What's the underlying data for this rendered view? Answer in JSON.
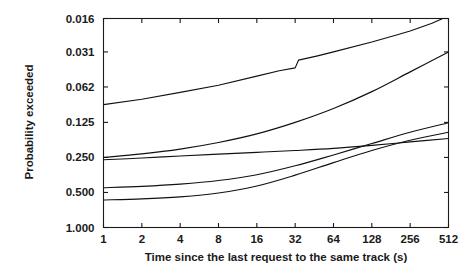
{
  "chart_data": {
    "type": "line",
    "title": "",
    "xlabel": "Time since the last request to the same track (s)",
    "ylabel": "Probability exceeded",
    "xscale": "log2",
    "yscale": "log2-reversed",
    "xlim": [
      1,
      512
    ],
    "ylim": [
      1.0,
      0.016
    ],
    "grid": false,
    "legend": null,
    "xticks": [
      1,
      2,
      4,
      8,
      16,
      32,
      64,
      128,
      256,
      512
    ],
    "xticklabels": [
      "1",
      "2",
      "4",
      "8",
      "16",
      "32",
      "64",
      "128",
      "256",
      "512"
    ],
    "yticks": [
      0.016,
      0.031,
      0.062,
      0.125,
      0.25,
      0.5,
      1.0
    ],
    "yticklabels": [
      "0.016",
      "0.031",
      "0.062",
      "0.125",
      "0.250",
      "0.500",
      "1.000"
    ],
    "series": [
      {
        "name": "curve-1",
        "x": [
          1,
          2,
          4,
          8,
          16,
          24,
          32,
          34,
          48,
          64,
          128,
          200,
          256,
          380,
          512
        ],
        "y": [
          0.088,
          0.079,
          0.069,
          0.06,
          0.05,
          0.045,
          0.0425,
          0.0365,
          0.0335,
          0.031,
          0.0255,
          0.0222,
          0.0205,
          0.0176,
          0.0152
        ]
      },
      {
        "name": "curve-2",
        "x": [
          1,
          2,
          4,
          8,
          16,
          32,
          64,
          128,
          256,
          512
        ],
        "y": [
          0.25,
          0.233,
          0.212,
          0.186,
          0.157,
          0.125,
          0.095,
          0.068,
          0.046,
          0.031
        ]
      },
      {
        "name": "curve-3",
        "x": [
          1,
          2,
          4,
          8,
          16,
          32,
          64,
          128,
          256,
          512
        ],
        "y": [
          0.262,
          0.253,
          0.243,
          0.234,
          0.226,
          0.218,
          0.209,
          0.197,
          0.184,
          0.172
        ]
      },
      {
        "name": "curve-4",
        "x": [
          1,
          2,
          4,
          8,
          16,
          32,
          64,
          128,
          256,
          512
        ],
        "y": [
          0.455,
          0.443,
          0.424,
          0.395,
          0.352,
          0.295,
          0.238,
          0.19,
          0.152,
          0.126
        ]
      },
      {
        "name": "curve-5",
        "x": [
          1,
          2,
          4,
          8,
          16,
          32,
          64,
          128,
          256,
          512
        ],
        "y": [
          0.58,
          0.568,
          0.545,
          0.505,
          0.44,
          0.355,
          0.277,
          0.218,
          0.178,
          0.152
        ]
      }
    ]
  }
}
